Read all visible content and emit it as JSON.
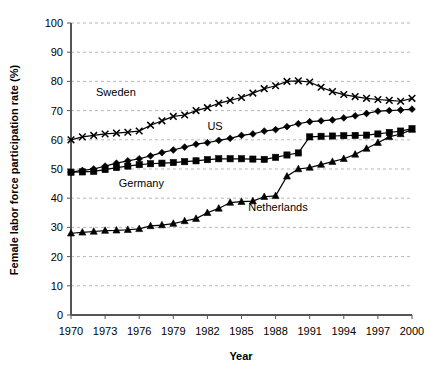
{
  "chart_data": {
    "type": "line",
    "title": "",
    "xlabel": "Year",
    "ylabel": "Female labor force participation rate (%)",
    "xlim": [
      1970,
      2000
    ],
    "ylim": [
      0,
      100
    ],
    "xticks": [
      "1970",
      "1973",
      "1976",
      "1979",
      "1982",
      "1985",
      "1988",
      "1991",
      "1994",
      "1997",
      "2000"
    ],
    "yticks": [
      "0",
      "10",
      "20",
      "30",
      "40",
      "50",
      "60",
      "70",
      "80",
      "90",
      "100"
    ],
    "grid": "horizontal-dashed",
    "legend_position": "inline-annotations",
    "x": [
      1970,
      1971,
      1972,
      1973,
      1974,
      1975,
      1976,
      1977,
      1978,
      1979,
      1980,
      1981,
      1982,
      1983,
      1984,
      1985,
      1986,
      1987,
      1988,
      1989,
      1990,
      1991,
      1992,
      1993,
      1994,
      1995,
      1996,
      1997,
      1998,
      1999,
      2000
    ],
    "series": [
      {
        "name": "Sweden",
        "marker": "x",
        "color": "#000000",
        "values": [
          60.0,
          61.0,
          61.5,
          62.0,
          62.3,
          62.6,
          63.0,
          65.0,
          66.5,
          68.0,
          68.5,
          70.0,
          71.0,
          72.5,
          73.5,
          74.5,
          76.0,
          77.5,
          78.5,
          80.0,
          80.2,
          79.8,
          78.0,
          76.5,
          75.5,
          74.8,
          74.2,
          73.8,
          73.5,
          73.2,
          74.2
        ]
      },
      {
        "name": "US",
        "marker": "diamond",
        "color": "#000000",
        "values": [
          48.9,
          49.5,
          50.0,
          51.0,
          52.0,
          52.8,
          53.5,
          54.5,
          55.6,
          56.5,
          57.5,
          58.5,
          59.0,
          59.8,
          60.5,
          61.5,
          62.0,
          63.0,
          63.5,
          64.5,
          65.5,
          66.2,
          66.5,
          66.8,
          67.5,
          68.2,
          69.0,
          69.8,
          70.0,
          70.2,
          70.5
        ]
      },
      {
        "name": "Germany",
        "marker": "square",
        "color": "#000000",
        "values": [
          48.9,
          49.0,
          49.2,
          49.8,
          50.5,
          51.0,
          51.5,
          51.8,
          52.0,
          52.2,
          52.5,
          52.8,
          53.2,
          53.5,
          53.5,
          53.5,
          53.4,
          53.3,
          54.0,
          54.8,
          55.5,
          61.0,
          61.2,
          61.3,
          61.4,
          61.5,
          61.6,
          62.0,
          62.5,
          63.0,
          63.8
        ]
      },
      {
        "name": "Netherlands",
        "marker": "triangle",
        "color": "#000000",
        "values": [
          28.0,
          28.3,
          28.6,
          28.9,
          29.0,
          29.2,
          29.5,
          30.5,
          30.8,
          31.3,
          32.2,
          33.0,
          35.0,
          36.5,
          38.5,
          38.8,
          39.0,
          40.5,
          40.8,
          47.5,
          50.0,
          50.5,
          51.5,
          52.5,
          53.5,
          55.0,
          57.0,
          59.0,
          61.0,
          62.0,
          63.5
        ]
      }
    ],
    "annotations": [
      {
        "text": "Sweden",
        "x": 1972.2,
        "y": 75.0
      },
      {
        "text": "US",
        "x": 1982.0,
        "y": 63.5
      },
      {
        "text": "Germany",
        "x": 1974.2,
        "y": 44.0
      },
      {
        "text": "Netherlands",
        "x": 1985.6,
        "y": 35.5
      }
    ]
  }
}
